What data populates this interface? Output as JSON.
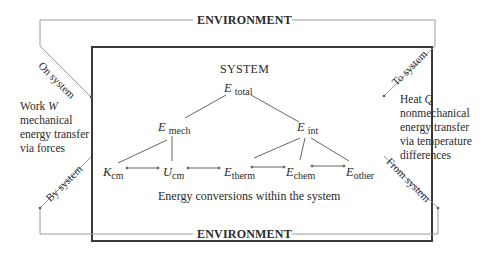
{
  "environment": {
    "top_label": "ENVIRONMENT",
    "bottom_label": "ENVIRONMENT"
  },
  "system": {
    "title": "SYSTEM",
    "caption": "Energy conversions within the system"
  },
  "nodes": {
    "total": {
      "symbol": "E",
      "sub": "total"
    },
    "mech": {
      "symbol": "E",
      "sub": "mech"
    },
    "int": {
      "symbol": "E",
      "sub": "int"
    },
    "kcm": {
      "symbol": "K",
      "sub": "cm"
    },
    "ucm": {
      "symbol": "U",
      "sub": "cm"
    },
    "therm": {
      "symbol": "E",
      "sub": "therm"
    },
    "chem": {
      "symbol": "E",
      "sub": "chem"
    },
    "other": {
      "symbol": "E",
      "sub": "other"
    }
  },
  "work": {
    "line1_prefix": "Work ",
    "line1_symbol": "W",
    "line2": "mechanical",
    "line3": "energy transfer",
    "line4": "via forces"
  },
  "heat": {
    "line1_prefix": "Heat ",
    "line1_symbol": "Q",
    "line2": "nonmechanical",
    "line3": "energy transfer",
    "line4": "via temperature",
    "line5": "differences"
  },
  "arrows": {
    "on_system": "On system",
    "by_system": "By system",
    "to_system": "To system",
    "from_system": "From system"
  },
  "colors": {
    "frame": "#3a3a3a",
    "env_line": "#9a9a9a",
    "text": "#2a2a2a"
  }
}
